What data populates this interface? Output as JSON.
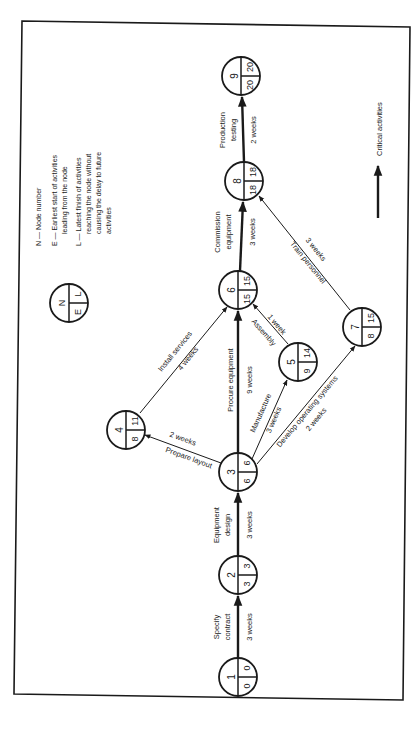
{
  "figure": {
    "rotation_deg": -90,
    "border_color": "#1a1a1a",
    "legend": {
      "node_symbol": {
        "N": "N",
        "E": "E",
        "L": "L"
      },
      "lines": [
        "N — Node number",
        "E — Earliest start of activities",
        "leading from the node",
        "L — Latest finish of activities",
        "reaching the node without",
        "causing the delay to future",
        "activities"
      ],
      "critical_label": "Critical activities"
    },
    "nodes": [
      {
        "n": "1",
        "e": "0",
        "l": "0"
      },
      {
        "n": "2",
        "e": "3",
        "l": "3"
      },
      {
        "n": "3",
        "e": "6",
        "l": "6"
      },
      {
        "n": "4",
        "e": "8",
        "l": "11"
      },
      {
        "n": "5",
        "e": "9",
        "l": "14"
      },
      {
        "n": "6",
        "e": "15",
        "l": "15"
      },
      {
        "n": "7",
        "e": "8",
        "l": "15"
      },
      {
        "n": "8",
        "e": "18",
        "l": "18"
      },
      {
        "n": "9",
        "e": "20",
        "l": "20"
      }
    ],
    "activities": [
      {
        "from": "1",
        "to": "2",
        "name": "Specify contract",
        "name_lines": [
          "Specify",
          "contract"
        ],
        "duration": "3 weeks",
        "critical": true
      },
      {
        "from": "2",
        "to": "3",
        "name": "Equipment design",
        "name_lines": [
          "Equipment",
          "design"
        ],
        "duration": "3 weeks",
        "critical": true
      },
      {
        "from": "3",
        "to": "4",
        "name": "Prepare layout",
        "duration": "2 weeks",
        "critical": false
      },
      {
        "from": "3",
        "to": "6",
        "name": "Procure equipment",
        "duration": "9 weeks",
        "critical": true
      },
      {
        "from": "3",
        "to": "5",
        "name": "Manufacture",
        "duration": "3 weeks",
        "critical": false
      },
      {
        "from": "3",
        "to": "7",
        "name": "Develop operating systems",
        "duration": "2 weeks",
        "critical": false
      },
      {
        "from": "4",
        "to": "6",
        "name": "Install services",
        "duration": "4 weeks",
        "critical": false
      },
      {
        "from": "5",
        "to": "6",
        "name": "Assembly",
        "duration": "1 week",
        "critical": false
      },
      {
        "from": "6",
        "to": "8",
        "name": "Commission equipment",
        "name_lines": [
          "Commission",
          "equipment"
        ],
        "duration": "3 weeks",
        "critical": true
      },
      {
        "from": "7",
        "to": "8",
        "name": "Train personnel",
        "duration": "3 weeks",
        "critical": false
      },
      {
        "from": "8",
        "to": "9",
        "name": "Production testing",
        "name_lines": [
          "Production",
          "testing"
        ],
        "duration": "2 weeks",
        "critical": true
      }
    ]
  }
}
